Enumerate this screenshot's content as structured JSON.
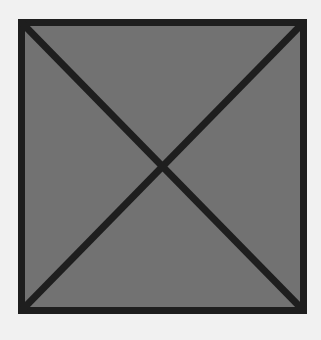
{
  "image_placeholder": {
    "icon": "crossed-box-icon",
    "colors": {
      "background": "#f1f1f1",
      "fill": "#727272",
      "stroke": "#1e1e1e"
    }
  }
}
